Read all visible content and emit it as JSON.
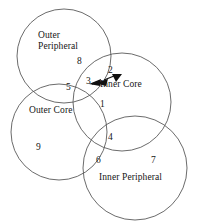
{
  "diagram": {
    "type": "venn-four-circle",
    "background_color": "#ffffff",
    "stroke_color": "#5a5a5a",
    "text_color": "#151515",
    "sets": [
      {
        "id": "outer-peripheral",
        "label_line1": "Outer",
        "label_line2": "Peripheral",
        "label_full": "Outer Peripheral"
      },
      {
        "id": "outer-core",
        "label_line1": "Outer Core",
        "label_line2": "",
        "label_full": "Outer Core"
      },
      {
        "id": "inner-core",
        "label_line1": "Inner Core",
        "label_line2": "",
        "label_full": "Inner Core"
      },
      {
        "id": "inner-peripheral",
        "label_line1": "Inner Peripheral",
        "label_line2": "",
        "label_full": "Inner Peripheral"
      }
    ],
    "region_numbers": [
      {
        "id": "region-1",
        "value": "1"
      },
      {
        "id": "region-2",
        "value": "2"
      },
      {
        "id": "region-3",
        "value": "3"
      },
      {
        "id": "region-4",
        "value": "4"
      },
      {
        "id": "region-5",
        "value": "5"
      },
      {
        "id": "region-6",
        "value": "6"
      },
      {
        "id": "region-7",
        "value": "7"
      },
      {
        "id": "region-8",
        "value": "8"
      },
      {
        "id": "region-9",
        "value": "9"
      }
    ],
    "annotations": [
      {
        "id": "arrow-left",
        "kind": "arrowhead",
        "direction": "left"
      },
      {
        "id": "arrow-right",
        "kind": "arrowhead",
        "direction": "right"
      }
    ]
  }
}
